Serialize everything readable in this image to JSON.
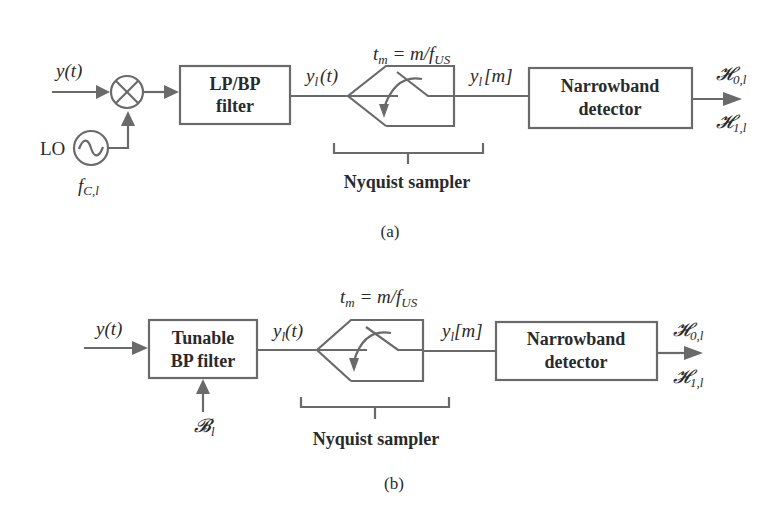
{
  "figure_a": {
    "input_label": "y(t)",
    "mixer_symbol": "⊗",
    "lo_label": "LO",
    "lo_freq": {
      "base": "f",
      "sub": "C,l"
    },
    "filter_line1": "LP/BP",
    "filter_line2": "filter",
    "filtered_signal": {
      "base": "y",
      "sub": "l",
      "tail": "(t)"
    },
    "sampling_time": {
      "t": "t",
      "t_sub": "m",
      "eq": " = m/f",
      "f_sub": "US"
    },
    "sampled_signal": {
      "base": "y",
      "sub": "l",
      "tail": "[m]"
    },
    "sampler_caption": "Nyquist sampler",
    "detector_line1": "Narrowband",
    "detector_line2": "detector",
    "hyp0": {
      "base": "𝓗",
      "sub": "0,l"
    },
    "hyp1": {
      "base": "𝓗",
      "sub": "1,l"
    },
    "caption": "(a)"
  },
  "figure_b": {
    "input_label": "y(t)",
    "filter_line1": "Tunable",
    "filter_line2": "BP filter",
    "band_label": {
      "base": "𝓑",
      "sub": "l"
    },
    "filtered_signal": {
      "base": "y",
      "sub": "l",
      "tail": "(t)"
    },
    "sampling_time": {
      "t": "t",
      "t_sub": "m",
      "eq": " = m/f",
      "f_sub": "US"
    },
    "sampled_signal": {
      "base": "y",
      "sub": "l",
      "tail": "[m]"
    },
    "sampler_caption": "Nyquist sampler",
    "detector_line1": "Narrowband",
    "detector_line2": "detector",
    "hyp0": {
      "base": "𝓗",
      "sub": "0,l"
    },
    "hyp1": {
      "base": "𝓗",
      "sub": "1,l"
    },
    "caption": "(b)"
  },
  "colors": {
    "line": "#6a6a6a",
    "text": "#2a2a2a",
    "background": "#ffffff"
  }
}
